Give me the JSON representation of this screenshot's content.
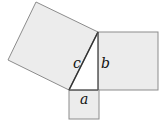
{
  "diagram": {
    "type": "pythagorean-theorem",
    "labels": {
      "a": "a",
      "b": "b",
      "c": "c"
    },
    "colors": {
      "fill": "#ececec",
      "stroke": "#8c8c8c",
      "background": "#ffffff"
    },
    "squares": [
      {
        "name": "square-a",
        "side": "a"
      },
      {
        "name": "square-b",
        "side": "b"
      },
      {
        "name": "square-c",
        "side": "c"
      }
    ]
  }
}
